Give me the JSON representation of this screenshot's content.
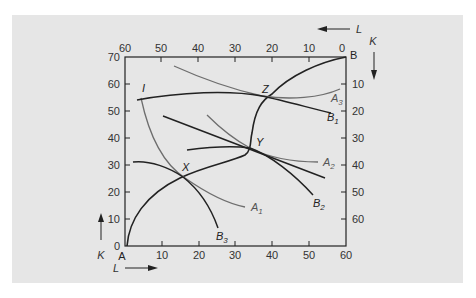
{
  "diagram": {
    "type": "edgeworth-box-production",
    "corners": {
      "origin_A": "A",
      "origin_B": "B"
    },
    "axes": {
      "bottom": {
        "name": "L",
        "direction": "right",
        "ticks": [
          "10",
          "20",
          "30",
          "40",
          "50",
          "60"
        ]
      },
      "left": {
        "name": "K",
        "direction": "up",
        "ticks": [
          "0",
          "10",
          "20",
          "30",
          "40",
          "50",
          "60",
          "70"
        ]
      },
      "top": {
        "name": "L",
        "direction": "left",
        "ticks": [
          "60",
          "50",
          "40",
          "30",
          "20",
          "10",
          "0"
        ]
      },
      "right": {
        "name": "K",
        "direction": "down",
        "ticks": [
          "10",
          "20",
          "30",
          "40",
          "50",
          "60"
        ]
      }
    },
    "points": {
      "x": "X",
      "y": "Y",
      "z": "Z",
      "i": "I"
    },
    "curves": {
      "a1": {
        "base": "A",
        "sub": "1"
      },
      "a2": {
        "base": "A",
        "sub": "2"
      },
      "a3": {
        "base": "A",
        "sub": "3"
      },
      "b1": {
        "base": "B",
        "sub": "1"
      },
      "b2": {
        "base": "B",
        "sub": "2"
      },
      "b3": {
        "base": "B",
        "sub": "3"
      }
    },
    "colors": {
      "panel_bg": "#e6e6e6",
      "dark_curve": "#222222",
      "gray_curve": "#6e6e6e"
    }
  }
}
